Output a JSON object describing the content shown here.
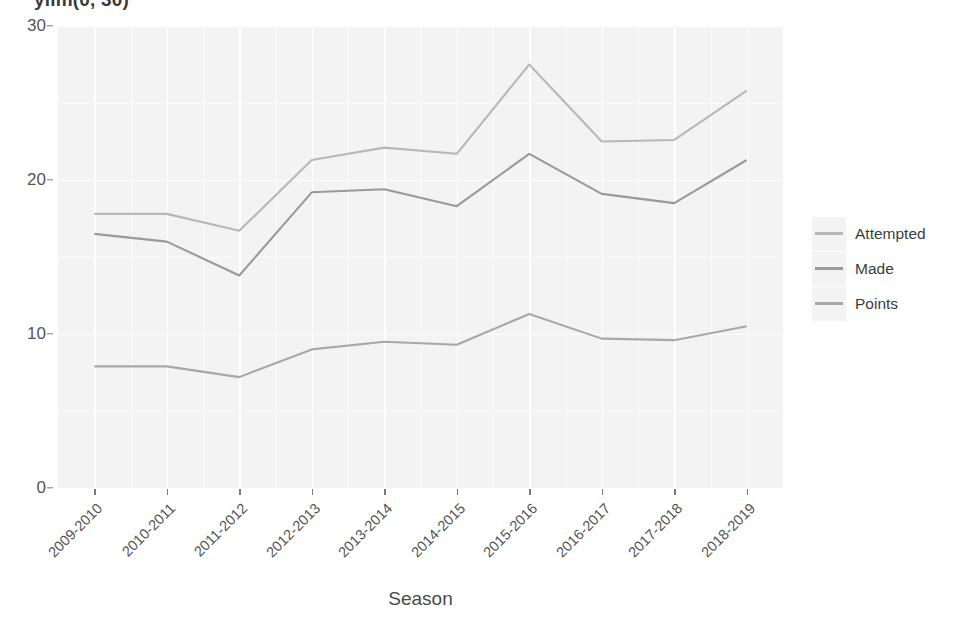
{
  "chart_data": {
    "type": "line",
    "title": "ylim(0, 30)",
    "xlabel": "Season",
    "ylabel": "",
    "categories": [
      "2009-2010",
      "2010-2011",
      "2011-2012",
      "2012-2013",
      "2013-2014",
      "2014-2015",
      "2015-2016",
      "2016-2017",
      "2017-2018",
      "2018-2019"
    ],
    "series": [
      {
        "name": "Attempted",
        "color": "#b8b8b8",
        "values": [
          17.8,
          17.8,
          16.7,
          21.3,
          22.1,
          21.7,
          27.5,
          22.5,
          22.6,
          25.8
        ]
      },
      {
        "name": "Made",
        "color": "#9a9a9a",
        "values": [
          16.5,
          16.0,
          13.8,
          19.2,
          19.4,
          18.3,
          21.7,
          19.1,
          18.5,
          21.3
        ]
      },
      {
        "name": "Points",
        "color": "#a8a8a8",
        "values": [
          7.9,
          7.9,
          7.2,
          9.0,
          9.5,
          9.3,
          11.3,
          9.7,
          9.6,
          10.5
        ]
      }
    ],
    "ylim": [
      0,
      30
    ],
    "y_ticks": [
      0,
      10,
      20,
      30
    ],
    "y_minor_ticks": [
      5,
      15,
      25
    ],
    "grid": true,
    "legend_position": "right",
    "panel_background": "#f3f3f3",
    "grid_color": "#ffffff"
  },
  "legend": {
    "entries": [
      {
        "label": "Attempted"
      },
      {
        "label": "Made"
      },
      {
        "label": "Points"
      }
    ]
  }
}
